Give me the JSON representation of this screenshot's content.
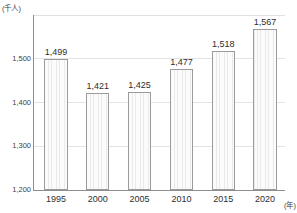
{
  "chart_data": {
    "type": "bar",
    "title": "",
    "subtitle": "",
    "xlabel": "(年)",
    "ylabel": "(千人)",
    "categories": [
      "1995",
      "2000",
      "2005",
      "2010",
      "2015",
      "2020"
    ],
    "values": [
      1499,
      1421,
      1425,
      1477,
      1518,
      1567
    ],
    "value_labels": [
      "1,499",
      "1,421",
      "1,425",
      "1,477",
      "1,518",
      "1,567"
    ],
    "ylim": [
      1200,
      1600
    ],
    "ytick_values": [
      1200,
      1300,
      1400,
      1500,
      1600
    ],
    "ytick_labels": [
      "1,200",
      "1,300",
      "1,400",
      "1,500",
      ""
    ],
    "gridlines": true,
    "legend": null,
    "bar_fill_color": "#f4f4f4",
    "bar_edge_color": "#9b9b9b",
    "axis_color": "#8e8e8e",
    "gridline_color": "#e3e3e6",
    "text_color": "#2e2e2e"
  }
}
